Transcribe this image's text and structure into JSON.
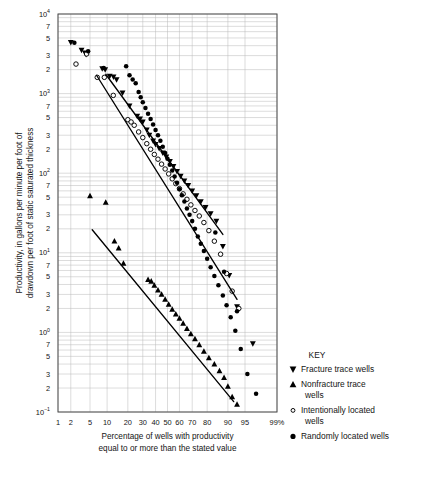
{
  "chart_data": {
    "type": "scatter",
    "title": "",
    "xlabel": "Percentage of wells with productivity equal to or more than the stated value",
    "ylabel": "Productivity, in gallons per minute per foot of drawdown per foot of static saturated thickness",
    "x_scale": "probability",
    "y_scale": "log",
    "ylim": [
      0.1,
      10000
    ],
    "xlim": [
      1,
      99
    ],
    "grid": true,
    "legend_position": "right",
    "legend_title": "KEY",
    "x_ticks": [
      "1",
      "2",
      "5",
      "10",
      "20",
      "30",
      "40",
      "50",
      "60",
      "70",
      "80",
      "90",
      "95",
      "99%"
    ],
    "x_tick_values": [
      1,
      2,
      5,
      10,
      20,
      30,
      40,
      50,
      60,
      70,
      80,
      90,
      95,
      99
    ],
    "y_decade_labels": [
      "10⁴",
      "10³",
      "10²",
      "10¹",
      "10⁰",
      "10⁻¹"
    ],
    "y_minor_labels": [
      "7",
      "5",
      "3",
      "2"
    ],
    "series": [
      {
        "name": "Fracture trace wells",
        "marker": "filled-down-triangle",
        "color": "#000000",
        "points": [
          [
            2.0,
            4400
          ],
          [
            3.4,
            3500
          ],
          [
            4.0,
            3250
          ],
          [
            4.2,
            3100
          ],
          [
            8.3,
            2050
          ],
          [
            9.3,
            2000
          ],
          [
            11.0,
            1650
          ],
          [
            12.6,
            1620
          ],
          [
            14.0,
            1500
          ],
          [
            17.0,
            1020
          ],
          [
            21.0,
            700
          ],
          [
            26.0,
            520
          ],
          [
            28.0,
            480
          ],
          [
            30.0,
            440
          ],
          [
            33.0,
            350
          ],
          [
            35.0,
            300
          ],
          [
            38.0,
            255
          ],
          [
            40.0,
            230
          ],
          [
            43.0,
            205
          ],
          [
            46.0,
            180
          ],
          [
            49.0,
            160
          ],
          [
            52.0,
            140
          ],
          [
            55.0,
            122
          ],
          [
            58.0,
            105
          ],
          [
            61.0,
            92
          ],
          [
            64.0,
            80
          ],
          [
            67.0,
            70
          ],
          [
            70.0,
            60
          ],
          [
            73.0,
            52
          ],
          [
            76.0,
            44
          ],
          [
            79.0,
            37
          ],
          [
            82.0,
            31
          ],
          [
            85.0,
            25
          ],
          [
            88.0,
            12
          ],
          [
            90.5,
            5.2
          ],
          [
            93.0,
            2.1
          ],
          [
            96.5,
            0.72
          ]
        ]
      },
      {
        "name": "Nonfracture trace wells",
        "marker": "filled-up-triangle",
        "color": "#000000",
        "points": [
          [
            5.0,
            52
          ],
          [
            9.5,
            43
          ],
          [
            13.0,
            14
          ],
          [
            15.0,
            11.5
          ],
          [
            17.5,
            7.4
          ],
          [
            34.0,
            4.6
          ],
          [
            36.5,
            4.4
          ],
          [
            39.0,
            3.9
          ],
          [
            42.0,
            3.4
          ],
          [
            45.0,
            3.0
          ],
          [
            48.0,
            2.6
          ],
          [
            51.0,
            2.25
          ],
          [
            54.0,
            1.95
          ],
          [
            57.0,
            1.7
          ],
          [
            60.0,
            1.5
          ],
          [
            63.0,
            1.3
          ],
          [
            66.0,
            1.12
          ],
          [
            69.0,
            0.96
          ],
          [
            72.0,
            0.83
          ],
          [
            75.0,
            0.7
          ],
          [
            78.0,
            0.58
          ],
          [
            81.0,
            0.48
          ],
          [
            84.0,
            0.4
          ],
          [
            86.5,
            0.33
          ],
          [
            88.5,
            0.27
          ],
          [
            90.0,
            0.21
          ],
          [
            91.5,
            0.155
          ],
          [
            93.0,
            0.125
          ]
        ]
      },
      {
        "name": "Intentionally located wells",
        "marker": "open-circle",
        "color": "#000000",
        "points": [
          [
            2.6,
            2350
          ],
          [
            4.3,
            3150
          ],
          [
            6.8,
            1600
          ],
          [
            9.0,
            1600
          ],
          [
            12.5,
            950
          ],
          [
            20.0,
            470
          ],
          [
            22.0,
            440
          ],
          [
            24.0,
            400
          ],
          [
            27.0,
            330
          ],
          [
            30.0,
            280
          ],
          [
            33.0,
            235
          ],
          [
            36.0,
            200
          ],
          [
            39.0,
            172
          ],
          [
            42.0,
            150
          ],
          [
            45.0,
            130
          ],
          [
            48.0,
            113
          ],
          [
            51.0,
            98
          ],
          [
            54.0,
            85
          ],
          [
            57.0,
            74
          ],
          [
            60.0,
            64
          ],
          [
            63.0,
            55
          ],
          [
            66.0,
            47
          ],
          [
            69.0,
            40
          ],
          [
            72.0,
            34
          ],
          [
            75.0,
            29
          ],
          [
            78.0,
            24
          ],
          [
            81.0,
            19
          ],
          [
            84.0,
            14
          ],
          [
            87.0,
            9.6
          ],
          [
            89.5,
            5.5
          ],
          [
            91.5,
            3.3
          ],
          [
            93.5,
            2.0
          ]
        ]
      },
      {
        "name": "Randomly located wells",
        "marker": "filled-circle",
        "color": "#000000",
        "points": [
          [
            2.4,
            4350
          ],
          [
            4.6,
            3400
          ],
          [
            8.8,
            2100
          ],
          [
            19.0,
            2200
          ],
          [
            21.0,
            1700
          ],
          [
            23.0,
            1500
          ],
          [
            25.0,
            1350
          ],
          [
            27.0,
            1050
          ],
          [
            28.5,
            900
          ],
          [
            30.0,
            780
          ],
          [
            32.0,
            660
          ],
          [
            34.0,
            560
          ],
          [
            36.0,
            480
          ],
          [
            38.0,
            410
          ],
          [
            40.0,
            350
          ],
          [
            42.0,
            300
          ],
          [
            44.0,
            255
          ],
          [
            46.0,
            215
          ],
          [
            48.0,
            180
          ],
          [
            50.0,
            152
          ],
          [
            52.0,
            128
          ],
          [
            54.0,
            108
          ],
          [
            56.0,
            91
          ],
          [
            58.0,
            76
          ],
          [
            60.0,
            63
          ],
          [
            62.0,
            53
          ],
          [
            64.0,
            44
          ],
          [
            66.0,
            36
          ],
          [
            68.0,
            30
          ],
          [
            70.0,
            25
          ],
          [
            72.0,
            20
          ],
          [
            74.0,
            16
          ],
          [
            76.0,
            13
          ],
          [
            78.0,
            10.5
          ],
          [
            80.0,
            8.4
          ],
          [
            82.0,
            6.6
          ],
          [
            84.0,
            5.1
          ],
          [
            86.0,
            3.9
          ],
          [
            88.0,
            2.9
          ],
          [
            89.5,
            2.2
          ],
          [
            91.0,
            1.55
          ],
          [
            92.5,
            1.05
          ],
          [
            94.0,
            0.62
          ],
          [
            95.5,
            0.3
          ],
          [
            97.0,
            0.17
          ],
          [
            93.0,
            1.85
          ],
          [
            88.5,
            5.8
          ],
          [
            84.5,
            18.0
          ]
        ]
      }
    ],
    "fit_lines": [
      {
        "name": "fracture-trace-fit",
        "x1": 9.5,
        "y1": 1750,
        "x2": 88.0,
        "y2": 17.0
      },
      {
        "name": "intentionally-located-fit",
        "x1": 6.6,
        "y1": 1700,
        "x2": 93.0,
        "y2": 2.6
      },
      {
        "name": "nonfracture-trace-fit",
        "x1": 5.5,
        "y1": 19.5,
        "x2": 92.0,
        "y2": 0.135
      }
    ],
    "legend": [
      {
        "marker": "filled-down-triangle",
        "label": "Fracture trace wells"
      },
      {
        "marker": "filled-up-triangle",
        "label": "Nonfracture trace wells"
      },
      {
        "marker": "open-circle",
        "label": "Intentionally located wells"
      },
      {
        "marker": "filled-circle",
        "label": "Randomly located wells"
      }
    ]
  }
}
